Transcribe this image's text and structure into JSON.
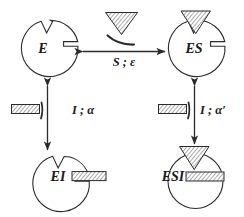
{
  "figure": {
    "type": "reaction-scheme",
    "background_color": "#ffffff",
    "line_color": "#2b2b2b",
    "text_color": "#1a1a1a"
  },
  "nodes": [
    {
      "id": "E",
      "label": "E",
      "position": "top-left",
      "shape": "circle-with-top-notch-and-right-slot",
      "bound_substrate": false,
      "bound_inhibitor": false
    },
    {
      "id": "ES",
      "label": "ES",
      "position": "top-right",
      "shape": "circle-with-top-notch-and-right-slot",
      "bound_substrate": true,
      "bound_inhibitor": false
    },
    {
      "id": "EI",
      "label": "EI",
      "position": "bottom-left",
      "shape": "circle-with-top-notch-and-right-slot",
      "bound_substrate": false,
      "bound_inhibitor": true
    },
    {
      "id": "ESI",
      "label": "ESI",
      "position": "bottom-right",
      "shape": "circle-with-top-notch-and-right-slot",
      "bound_substrate": true,
      "bound_inhibitor": true
    }
  ],
  "edges": [
    {
      "id": "E-ES",
      "from": "E",
      "to": "ES",
      "orientation": "horizontal",
      "arrow": "double",
      "label": "S ; ε",
      "label_parts": {
        "species": "S",
        "separator": ";",
        "constant": "ε"
      }
    },
    {
      "id": "E-EI",
      "from": "E",
      "to": "EI",
      "orientation": "vertical",
      "arrow": "double",
      "label": "I ; α",
      "label_parts": {
        "species": "I",
        "separator": ";",
        "constant": "α"
      }
    },
    {
      "id": "ES-ESI",
      "from": "ES",
      "to": "ESI",
      "orientation": "vertical",
      "arrow": "double",
      "label": "I ; α′",
      "label_parts": {
        "species": "I",
        "separator": ";",
        "constant": "α′"
      }
    }
  ],
  "ligands": [
    {
      "id": "free-substrate",
      "glyph": "hatched-triangle",
      "orientation": "point-down",
      "location": "above-horizontal-arrow",
      "has_swoosh": true
    },
    {
      "id": "free-inhibitor-left",
      "glyph": "hatched-rectangle",
      "location": "left-of-vertical-arrow-left",
      "has_swoosh": true
    },
    {
      "id": "free-inhibitor-right",
      "glyph": "hatched-rectangle",
      "location": "left-of-vertical-arrow-right",
      "has_swoosh": true
    }
  ]
}
